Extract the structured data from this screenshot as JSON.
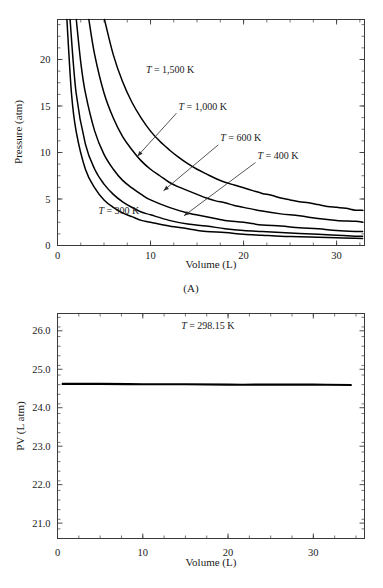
{
  "figure": {
    "panel_a_caption": "(A)"
  },
  "chart_data": [
    {
      "id": "panel-a",
      "type": "line",
      "title": "",
      "caption": "(A)",
      "xlabel": "Volume (L)",
      "ylabel": "Pressure (atm)",
      "xlim": [
        0,
        33
      ],
      "ylim": [
        0,
        24.3
      ],
      "xticks": [
        0,
        10,
        20,
        30
      ],
      "xtick_labels": [
        "0",
        "10",
        "20",
        "30"
      ],
      "xtick_minor_step": 2.5,
      "yticks": [
        0,
        5,
        10,
        15,
        20
      ],
      "ytick_labels": [
        "0",
        "5",
        "10",
        "15",
        "20"
      ],
      "ytick_minor_step": 1.25,
      "grid": false,
      "legend_position": "inline-annotations",
      "relation": "P = nRT / V  (ideal gas, n = 1 mol, R = 0.08206 L atm / mol K)",
      "series": [
        {
          "name": "T = 1,500 K",
          "temperature_K": 1500,
          "label": "T = 1,500 K",
          "nRT": 123.1,
          "x": [
            5.05,
            6,
            7,
            8,
            9,
            10,
            11,
            12,
            13,
            14,
            15,
            16,
            17,
            18,
            19,
            20,
            21,
            22,
            23,
            24,
            25,
            26,
            27,
            28,
            29,
            30,
            31,
            32,
            32.8
          ],
          "y": [
            24.4,
            20.5,
            17.6,
            15.4,
            13.7,
            12.3,
            11.2,
            10.3,
            9.5,
            8.8,
            8.2,
            7.7,
            7.2,
            6.8,
            6.5,
            6.2,
            5.9,
            5.6,
            5.4,
            5.1,
            4.9,
            4.7,
            4.6,
            4.4,
            4.2,
            4.1,
            4.0,
            3.8,
            3.8
          ]
        },
        {
          "name": "T = 1,000 K",
          "temperature_K": 1000,
          "label": "T = 1,000 K",
          "nRT": 82.1,
          "x": [
            3.37,
            4,
            5,
            6,
            7,
            8,
            9,
            10,
            11,
            12,
            13,
            14,
            15,
            16,
            17,
            18,
            19,
            20,
            22,
            24,
            26,
            28,
            30,
            32,
            32.8
          ],
          "y": [
            24.4,
            20.5,
            16.4,
            13.7,
            11.7,
            10.3,
            9.1,
            8.2,
            7.5,
            6.8,
            6.3,
            5.9,
            5.5,
            5.1,
            4.8,
            4.6,
            4.3,
            4.1,
            3.7,
            3.4,
            3.2,
            2.9,
            2.7,
            2.6,
            2.5
          ]
        },
        {
          "name": "T = 600 K",
          "temperature_K": 600,
          "label": "T = 600 K",
          "nRT": 49.2,
          "x": [
            2.02,
            2.5,
            3,
            4,
            5,
            6,
            7,
            8,
            9,
            10,
            12,
            14,
            16,
            18,
            20,
            22,
            24,
            26,
            28,
            30,
            32,
            32.8
          ],
          "y": [
            24.4,
            19.7,
            16.4,
            12.3,
            9.8,
            8.2,
            7.0,
            6.2,
            5.5,
            4.9,
            4.1,
            3.5,
            3.1,
            2.7,
            2.5,
            2.2,
            2.1,
            1.9,
            1.8,
            1.6,
            1.5,
            1.5
          ]
        },
        {
          "name": "T = 400 K",
          "temperature_K": 400,
          "label": "T = 400 K",
          "nRT": 32.8,
          "x": [
            1.35,
            2,
            3,
            4,
            5,
            6,
            7,
            8,
            9,
            10,
            12,
            14,
            16,
            18,
            20,
            22,
            24,
            26,
            28,
            30,
            32,
            32.8
          ],
          "y": [
            24.4,
            16.4,
            10.9,
            8.2,
            6.6,
            5.5,
            4.7,
            4.1,
            3.6,
            3.3,
            2.7,
            2.3,
            2.1,
            1.8,
            1.6,
            1.5,
            1.4,
            1.3,
            1.2,
            1.1,
            1.0,
            1.0
          ]
        },
        {
          "name": "T = 300 K",
          "temperature_K": 300,
          "label": "T = 300 K",
          "nRT": 24.6,
          "x": [
            1.01,
            1.5,
            2,
            3,
            4,
            5,
            6,
            7,
            8,
            9,
            10,
            12,
            14,
            16,
            18,
            20,
            22,
            24,
            26,
            28,
            30,
            32,
            32.8
          ],
          "y": [
            24.4,
            16.4,
            12.3,
            8.2,
            6.2,
            4.9,
            4.1,
            3.5,
            3.1,
            2.7,
            2.5,
            2.1,
            1.8,
            1.5,
            1.4,
            1.2,
            1.1,
            1.0,
            0.95,
            0.88,
            0.82,
            0.77,
            0.75
          ]
        }
      ],
      "annotations": [
        {
          "text": "T = 1,500 K",
          "x": 9.5,
          "y": 18.6,
          "leader": false
        },
        {
          "text": "T = 1,000 K",
          "x": 13.0,
          "y": 14.6,
          "leader": true,
          "arrow_x": 8.6,
          "arrow_y": 9.6
        },
        {
          "text": "T = 600 K",
          "x": 17.5,
          "y": 11.2,
          "leader": true,
          "arrow_x": 11.4,
          "arrow_y": 5.9
        },
        {
          "text": "T = 400 K",
          "x": 21.5,
          "y": 9.3,
          "leader": true,
          "arrow_x": 13.6,
          "arrow_y": 3.2
        },
        {
          "text": "T = 300 K",
          "x": 4.4,
          "y": 3.4,
          "leader": false
        }
      ]
    },
    {
      "id": "panel-b",
      "type": "line",
      "title": "",
      "caption": "",
      "xlabel": "Volume (L)",
      "ylabel": "PV (L atm)",
      "xlim": [
        0,
        36
      ],
      "ylim": [
        20.6,
        26.45
      ],
      "xticks": [
        0,
        10,
        20,
        30
      ],
      "xtick_labels": [
        "0",
        "10",
        "20",
        "30"
      ],
      "xtick_minor_step": 2.5,
      "yticks": [
        21.0,
        22.0,
        23.0,
        24.0,
        25.0,
        26.0
      ],
      "ytick_labels": [
        "21.0",
        "22.0",
        "23.0",
        "24.0",
        "25.0",
        "26.0"
      ],
      "ytick_minor_step": 0.25,
      "grid": false,
      "legend_position": "inline-annotation",
      "relation": "PV = nRT = constant at fixed T",
      "series": [
        {
          "name": "T = 298.15 K",
          "temperature_K": 298.15,
          "label": "T = 298.15 K",
          "constant_PV": 24.6,
          "x": [
            0.5,
            5,
            10,
            15,
            20,
            25,
            30,
            34.5
          ],
          "y": [
            24.62,
            24.62,
            24.61,
            24.61,
            24.6,
            24.6,
            24.6,
            24.59
          ]
        }
      ],
      "annotations": [
        {
          "text": "T = 298.15 K",
          "x": 14.5,
          "y": 26.05,
          "leader": false
        }
      ]
    }
  ]
}
